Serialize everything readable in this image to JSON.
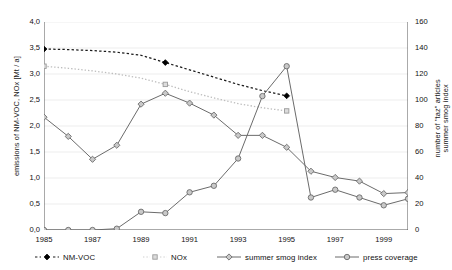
{
  "axes": {
    "y_left_title": "emissions of NM-VOC, NOx [Mt / a]",
    "y_right_title_line1": "number of \"taz\" articles",
    "y_right_title_line2": "summer smog index",
    "y_left_ticks": [
      "0,0",
      "0,5",
      "1,0",
      "1,5",
      "2,0",
      "2,5",
      "3,0",
      "3,5",
      "4,0"
    ],
    "y_right_ticks": [
      "0",
      "20",
      "40",
      "60",
      "80",
      "100",
      "120",
      "140",
      "160"
    ],
    "x_ticks": [
      "1985",
      "1987",
      "1989",
      "1991",
      "1993",
      "1995",
      "1997",
      "1999"
    ]
  },
  "legend": {
    "items": [
      {
        "label": "NM-VOC",
        "glyph": "dashed-filled-diamond-marker",
        "color": "#1a1a1a"
      },
      {
        "label": "NOx",
        "glyph": "dotted-light-square-marker",
        "color": "#bdbdbd"
      },
      {
        "label": "summer smog index",
        "glyph": "solid-diamond-marker",
        "color": "#6b6b6b"
      },
      {
        "label": "press coverage",
        "glyph": "solid-circle-marker",
        "color": "#6b6b6b"
      }
    ]
  },
  "chart_data": {
    "type": "line",
    "title": "",
    "xlabel": "",
    "ylabel": "emissions of NM-VOC, NOx [Mt / a]",
    "ylabel_secondary": "number of \"taz\" articles / summer smog index",
    "x": [
      1985,
      1986,
      1987,
      1988,
      1989,
      1990,
      1991,
      1992,
      1993,
      1994,
      1995,
      1996,
      1997,
      1998,
      1999,
      2000
    ],
    "xlim": [
      1985,
      2000
    ],
    "ylim": [
      0.0,
      4.0
    ],
    "ylim_secondary": [
      0,
      160
    ],
    "grid": true,
    "legend_position": "bottom",
    "series": [
      {
        "name": "NM-VOC",
        "axis": "left",
        "style": "dashed",
        "color": "#1a1a1a",
        "marker": "filled-diamond",
        "marker_years": [
          1985,
          1990,
          1995
        ],
        "values": [
          3.48,
          3.47,
          3.45,
          3.42,
          3.36,
          3.22,
          3.08,
          2.94,
          2.8,
          2.68,
          2.58,
          null,
          null,
          null,
          null,
          null
        ]
      },
      {
        "name": "NOx",
        "axis": "left",
        "style": "dotted",
        "color": "#bdbdbd",
        "marker": "square",
        "marker_years": [
          1985,
          1990,
          1995
        ],
        "values": [
          3.15,
          3.11,
          3.06,
          3.0,
          2.92,
          2.8,
          2.66,
          2.54,
          2.43,
          2.35,
          2.29,
          null,
          null,
          null,
          null,
          null
        ]
      },
      {
        "name": "summer smog index",
        "axis": "left",
        "style": "solid",
        "color": "#6b6b6b",
        "marker": "diamond",
        "values": [
          2.17,
          1.8,
          1.36,
          1.63,
          2.42,
          2.63,
          2.44,
          2.21,
          1.82,
          1.82,
          1.59,
          1.13,
          1.01,
          0.94,
          0.7,
          0.72
        ]
      },
      {
        "name": "press coverage",
        "axis": "right",
        "style": "solid",
        "color": "#6b6b6b",
        "marker": "circle",
        "values": [
          0,
          0,
          0,
          1,
          14,
          13,
          29,
          34,
          55,
          103,
          126,
          25,
          31,
          25,
          19,
          24
        ]
      }
    ]
  }
}
